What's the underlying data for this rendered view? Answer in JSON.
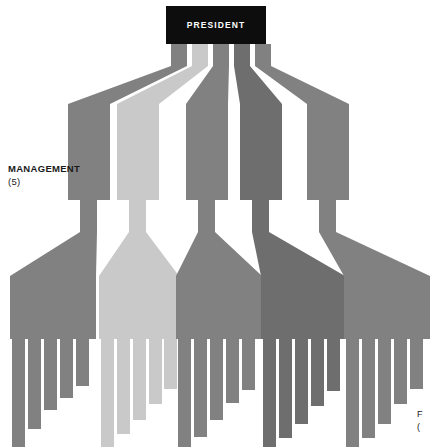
{
  "diagram": {
    "type": "organization-chart",
    "title_box": {
      "label": "PRESIDENT",
      "x": 166,
      "y": 6,
      "width": 100,
      "height": 38,
      "fill": "#0d0d0d",
      "text_color": "#ffffff"
    },
    "left_label": {
      "line1": "MANAGEMENT",
      "line2": "(5)"
    },
    "corner_note": {
      "line1": "F",
      "line2": "("
    },
    "palette": {
      "background": "#ffffff",
      "band_medium": "#818181",
      "band_light": "#c9c9c9",
      "band_dark": "#6e6e6e",
      "box_black": "#0d0d0d"
    },
    "branches": [
      {
        "name": "branch-1",
        "color": "#818181",
        "top_x": 171,
        "top_width": 16,
        "mid_x": 68,
        "mid_width": 42,
        "mgmt_box": {
          "x": 68,
          "y": 158,
          "width": 42,
          "height": 42
        },
        "stem_x": 80,
        "stem_width": 17,
        "bar": {
          "x": 10,
          "y": 309,
          "width": 86,
          "height": 30
        },
        "teeth": [
          {
            "x": 12,
            "width": 13,
            "bottom": 447
          },
          {
            "x": 28,
            "width": 13,
            "bottom": 429
          },
          {
            "x": 44,
            "width": 13,
            "bottom": 410
          },
          {
            "x": 60,
            "width": 13,
            "bottom": 398
          },
          {
            "x": 76,
            "width": 13,
            "bottom": 386
          }
        ]
      },
      {
        "name": "branch-2",
        "color": "#c9c9c9",
        "top_x": 192,
        "top_width": 16,
        "mid_x": 117,
        "mid_width": 42,
        "mgmt_box": {
          "x": 117,
          "y": 158,
          "width": 42,
          "height": 42
        },
        "stem_x": 129,
        "stem_width": 17,
        "bar": {
          "x": 99,
          "y": 309,
          "width": 80,
          "height": 30
        },
        "teeth": [
          {
            "x": 101,
            "width": 13,
            "bottom": 447
          },
          {
            "x": 117,
            "width": 13,
            "bottom": 434
          },
          {
            "x": 133,
            "width": 13,
            "bottom": 420
          },
          {
            "x": 149,
            "width": 13,
            "bottom": 404
          },
          {
            "x": 164,
            "width": 13,
            "bottom": 389
          }
        ]
      },
      {
        "name": "branch-3",
        "color": "#818181",
        "top_x": 213,
        "top_width": 16,
        "mid_x": 186,
        "mid_width": 42,
        "mgmt_box": {
          "x": 186,
          "y": 158,
          "width": 42,
          "height": 42
        },
        "stem_x": 198,
        "stem_width": 17,
        "bar": {
          "x": 176,
          "y": 309,
          "width": 86,
          "height": 30
        },
        "teeth": [
          {
            "x": 178,
            "width": 13,
            "bottom": 447
          },
          {
            "x": 194,
            "width": 13,
            "bottom": 437
          },
          {
            "x": 210,
            "width": 13,
            "bottom": 420
          },
          {
            "x": 226,
            "width": 13,
            "bottom": 403
          },
          {
            "x": 242,
            "width": 13,
            "bottom": 390
          }
        ]
      },
      {
        "name": "branch-4",
        "color": "#6e6e6e",
        "top_x": 234,
        "top_width": 16,
        "mid_x": 240,
        "mid_width": 42,
        "mgmt_box": {
          "x": 240,
          "y": 158,
          "width": 42,
          "height": 42
        },
        "stem_x": 252,
        "stem_width": 17,
        "bar": {
          "x": 261,
          "y": 309,
          "width": 84,
          "height": 30
        },
        "teeth": [
          {
            "x": 263,
            "width": 13,
            "bottom": 447
          },
          {
            "x": 279,
            "width": 13,
            "bottom": 438
          },
          {
            "x": 295,
            "width": 13,
            "bottom": 424
          },
          {
            "x": 311,
            "width": 13,
            "bottom": 406
          },
          {
            "x": 327,
            "width": 13,
            "bottom": 391
          }
        ]
      },
      {
        "name": "branch-5",
        "color": "#818181",
        "top_x": 255,
        "top_width": 16,
        "mid_x": 307,
        "mid_width": 42,
        "mgmt_box": {
          "x": 307,
          "y": 158,
          "width": 42,
          "height": 42
        },
        "stem_x": 319,
        "stem_width": 17,
        "bar": {
          "x": 344,
          "y": 309,
          "width": 86,
          "height": 30
        },
        "teeth": [
          {
            "x": 346,
            "width": 13,
            "bottom": 447
          },
          {
            "x": 362,
            "width": 13,
            "bottom": 438
          },
          {
            "x": 378,
            "width": 13,
            "bottom": 424
          },
          {
            "x": 394,
            "width": 13,
            "bottom": 404
          },
          {
            "x": 410,
            "width": 13,
            "bottom": 389
          }
        ]
      }
    ]
  }
}
